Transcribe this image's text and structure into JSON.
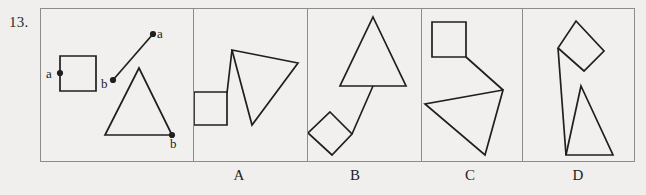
{
  "question": {
    "number": "13."
  },
  "prompt_panel": {
    "name": "prompt",
    "vertex_labels": [
      {
        "text": "a",
        "x": 46,
        "y": 66,
        "for": "square-left-vertex"
      },
      {
        "text": "b",
        "x": 101,
        "y": 76,
        "for": "segment-lower-endpoint"
      },
      {
        "text": "a",
        "x": 157,
        "y": 26,
        "for": "segment-upper-endpoint"
      },
      {
        "text": "b",
        "x": 170,
        "y": 136,
        "for": "triangle-right-vertex"
      }
    ],
    "shapes": {
      "square": {
        "x": 60,
        "y": 56,
        "w": 36,
        "h": 35
      },
      "segment": {
        "x1": 113,
        "y1": 80,
        "x2": 153,
        "y2": 34
      },
      "triangle": [
        [
          139,
          68
        ],
        [
          105,
          135
        ],
        [
          172,
          135
        ]
      ]
    },
    "dots": [
      {
        "x": 60,
        "y": 73
      },
      {
        "x": 113,
        "y": 80
      },
      {
        "x": 153,
        "y": 34
      },
      {
        "x": 172,
        "y": 135
      }
    ]
  },
  "options": [
    {
      "label": "A",
      "label_x": 224,
      "shapes": {
        "square": [
          [
            194,
            92
          ],
          [
            227,
            92
          ],
          [
            227,
            125
          ],
          [
            194,
            125
          ]
        ],
        "triangle": [
          [
            232,
            50
          ],
          [
            298,
            63
          ],
          [
            252,
            125
          ]
        ],
        "connector": {
          "x1": 227,
          "y1": 93,
          "x2": 232,
          "y2": 50
        }
      }
    },
    {
      "label": "B",
      "label_x": 340,
      "shapes": {
        "diamond": [
          [
            330,
            112
          ],
          [
            352,
            134
          ],
          [
            332,
            155
          ],
          [
            308,
            133
          ]
        ],
        "triangle": [
          [
            373,
            17
          ],
          [
            406,
            86
          ],
          [
            340,
            86
          ]
        ],
        "connector": {
          "x1": 352,
          "y1": 134,
          "x2": 373,
          "y2": 86
        }
      }
    },
    {
      "label": "C",
      "label_x": 455,
      "shapes": {
        "square": [
          [
            432,
            22
          ],
          [
            466,
            22
          ],
          [
            466,
            57
          ],
          [
            432,
            57
          ]
        ],
        "triangle": [
          [
            503,
            90
          ],
          [
            425,
            104
          ],
          [
            485,
            155
          ]
        ],
        "connector": {
          "x1": 466,
          "y1": 57,
          "x2": 503,
          "y2": 90
        }
      }
    },
    {
      "label": "D",
      "label_x": 563,
      "shapes": {
        "diamond": [
          [
            576,
            21
          ],
          [
            604,
            51
          ],
          [
            584,
            71
          ],
          [
            558,
            48
          ]
        ],
        "triangle": [
          [
            581,
            86
          ],
          [
            613,
            155
          ],
          [
            566,
            155
          ]
        ],
        "connector": {
          "x1": 558,
          "y1": 48,
          "x2": 566,
          "y2": 155
        }
      }
    }
  ],
  "dividers": [
    193,
    307,
    421,
    522
  ],
  "colors": {
    "background": "#f0efed",
    "frame_border": "#8d8c8a",
    "stroke": "#1f1f1f",
    "text": "#232323"
  }
}
